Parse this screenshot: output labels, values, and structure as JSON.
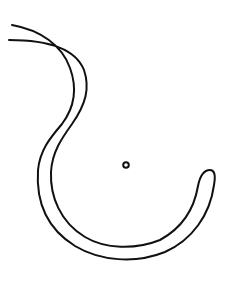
{
  "drawing": {
    "description": "Hand-drawn hook-shaped outline (double-line curved band) with a small circle",
    "stroke_color": "#111111",
    "background_color": "#ffffff",
    "shapes": [
      "hook-band-outline",
      "small-circle"
    ]
  }
}
